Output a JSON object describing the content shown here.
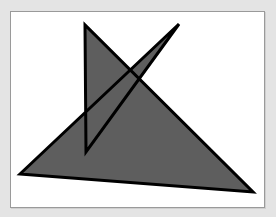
{
  "figure": {
    "background_color": "#e4e4e4",
    "canvas_color": "#ffffff",
    "fill_color": "#5e5e5e",
    "stroke_color": "#000000",
    "polygon_points": "20,174 179,24 86,152 85,25 253,192",
    "shapes": [
      {
        "name": "self-intersecting-polygon",
        "vertices": [
          [
            20,
            174
          ],
          [
            179,
            24
          ],
          [
            86,
            152
          ],
          [
            85,
            25
          ],
          [
            253,
            192
          ]
        ]
      }
    ]
  }
}
